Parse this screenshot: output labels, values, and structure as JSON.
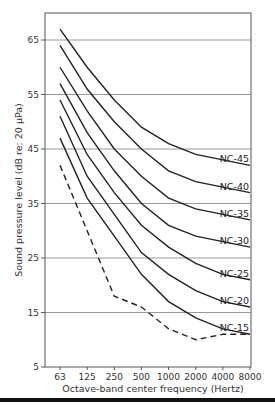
{
  "chart_data": {
    "type": "line",
    "title": "",
    "xlabel": "Octave-band center frequency (Hertz)",
    "ylabel": "Sound pressure level (dB re: 20 μPa)",
    "categories": [
      "63",
      "125",
      "250",
      "500",
      "1000",
      "2000",
      "4000",
      "8000"
    ],
    "yticks": [
      "5",
      "15",
      "25",
      "35",
      "45",
      "55",
      "65"
    ],
    "ylim": [
      5,
      70
    ],
    "grid": "horizontal",
    "series": [
      {
        "name": "NC-45",
        "label": "NC-45",
        "style": "solid",
        "values": [
          67,
          60,
          54,
          49,
          46,
          44,
          43,
          42
        ]
      },
      {
        "name": "NC-40",
        "label": "NC-40",
        "style": "solid",
        "values": [
          64,
          56,
          50,
          45,
          41,
          39,
          38,
          37
        ]
      },
      {
        "name": "NC-35",
        "label": "NC-35",
        "style": "solid",
        "values": [
          60,
          52,
          45,
          40,
          36,
          34,
          33,
          32
        ]
      },
      {
        "name": "NC-30",
        "label": "NC-30",
        "style": "solid",
        "values": [
          57,
          48,
          41,
          35,
          31,
          29,
          28,
          27
        ]
      },
      {
        "name": "NC-25",
        "label": "NC-25",
        "style": "solid",
        "values": [
          54,
          44,
          37,
          31,
          27,
          24,
          22,
          21
        ]
      },
      {
        "name": "NC-20",
        "label": "NC-20",
        "style": "solid",
        "values": [
          51,
          40,
          33,
          26,
          22,
          19,
          17,
          16
        ]
      },
      {
        "name": "NC-15",
        "label": "NC-15",
        "style": "solid",
        "values": [
          47,
          36,
          29,
          22,
          17,
          14,
          12,
          11
        ]
      },
      {
        "name": "threshold",
        "label": "",
        "style": "dashed",
        "values": [
          42,
          30,
          18,
          16,
          12,
          10,
          11,
          11
        ]
      }
    ]
  }
}
